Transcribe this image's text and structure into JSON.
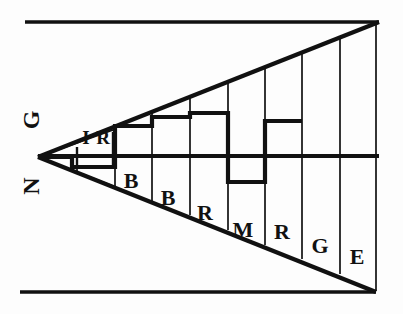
{
  "figure": {
    "background_color": "#fdfdfd",
    "ink_color": "#111111",
    "apex": {
      "x": 38,
      "y": 157
    },
    "axis": {
      "name": "horizontal-center-axis",
      "x1": 38,
      "y1": 156,
      "x2": 379,
      "y2": 156,
      "stroke_width": 3.5
    },
    "frame_lines": [
      {
        "name": "top-border-line",
        "x1": 25,
        "y1": 22,
        "x2": 379,
        "y2": 22,
        "stroke_width": 3.5
      },
      {
        "name": "bottom-border-line",
        "x1": 20,
        "y1": 292,
        "x2": 376,
        "y2": 292,
        "stroke_width": 3.5
      }
    ],
    "wedge": {
      "name": "wedge-outline",
      "upper_edge": {
        "x1": 38,
        "y1": 157,
        "x2": 379,
        "y2": 22
      },
      "lower_edge": {
        "x1": 38,
        "y1": 157,
        "x2": 376,
        "y2": 292
      },
      "right_edge": {
        "x1": 379,
        "y1": 22,
        "x2": 376,
        "y2": 292
      },
      "stroke_width": 4
    },
    "rotated_labels": [
      {
        "name": "label-g-rotated",
        "text": "G",
        "x": 33,
        "y": 120,
        "rotation": -90
      },
      {
        "name": "label-n-rotated",
        "text": "N",
        "x": 33,
        "y": 185,
        "rotation": -90
      }
    ],
    "dividers": [
      {
        "name": "divider-1",
        "x": 77
      },
      {
        "name": "divider-2",
        "x": 115
      },
      {
        "name": "divider-3",
        "x": 152
      },
      {
        "name": "divider-4",
        "x": 190
      },
      {
        "name": "divider-5",
        "x": 228
      },
      {
        "name": "divider-6",
        "x": 265
      },
      {
        "name": "divider-7",
        "x": 302
      },
      {
        "name": "divider-8",
        "x": 340
      }
    ],
    "segment_labels": [
      {
        "name": "segment-label-i",
        "text": "I",
        "x": 85,
        "y": 140,
        "size": "small"
      },
      {
        "name": "segment-label-r1",
        "text": "R",
        "x": 103,
        "y": 140,
        "size": "small"
      },
      {
        "name": "segment-label-b1",
        "text": "B",
        "x": 130,
        "y": 182,
        "size": "normal"
      },
      {
        "name": "segment-label-b2",
        "text": "B",
        "x": 168,
        "y": 200,
        "size": "normal"
      },
      {
        "name": "segment-label-r2",
        "text": "R",
        "x": 205,
        "y": 214,
        "size": "normal"
      },
      {
        "name": "segment-label-m",
        "text": "M",
        "x": 242,
        "y": 231,
        "size": "normal"
      },
      {
        "name": "segment-label-r3",
        "text": "R",
        "x": 281,
        "y": 233,
        "size": "normal"
      },
      {
        "name": "segment-label-g",
        "text": "G",
        "x": 319,
        "y": 248,
        "size": "normal"
      },
      {
        "name": "segment-label-e",
        "text": "E",
        "x": 356,
        "y": 258,
        "size": "normal"
      }
    ],
    "step_profile": {
      "name": "stepped-bar-outline",
      "description": "Step-like bar profile tracing deviations above and below the center axis",
      "points": [
        [
          72,
          156
        ],
        [
          72,
          166
        ],
        [
          115,
          166
        ],
        [
          115,
          126
        ],
        [
          152,
          126
        ],
        [
          152,
          117
        ],
        [
          190,
          117
        ],
        [
          190,
          113
        ],
        [
          228,
          113
        ],
        [
          228,
          182
        ],
        [
          265,
          182
        ],
        [
          265,
          121
        ],
        [
          302,
          121
        ]
      ],
      "stroke_width": 4
    },
    "small_wedge_marks": [
      {
        "name": "inner-wedge-line",
        "x1": 38,
        "y1": 157,
        "x2": 115,
        "y2": 136
      }
    ]
  }
}
